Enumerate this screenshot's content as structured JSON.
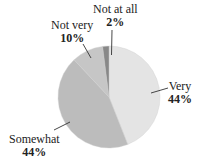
{
  "chart_data": {
    "type": "pie",
    "title": "",
    "categories": [
      "Very",
      "Somewhat",
      "Not very",
      "Not at all"
    ],
    "values": [
      44,
      44,
      10,
      2
    ],
    "value_labels": [
      "44%",
      "44%",
      "10%",
      "2%"
    ],
    "colors": [
      "#e4e4e4",
      "#bcbcbc",
      "#c6c6c6",
      "#888888"
    ],
    "start_angle_deg": 0,
    "direction": "clockwise",
    "legend": "none",
    "labels_position": "outside-with-leader-lines"
  },
  "labels": {
    "very": {
      "name": "Very",
      "pct": "44%"
    },
    "somewhat": {
      "name": "Somewhat",
      "pct": "44%"
    },
    "not_very": {
      "name": "Not very",
      "pct": "10%"
    },
    "not_at_all": {
      "name": "Not at all",
      "pct": "2%"
    }
  }
}
